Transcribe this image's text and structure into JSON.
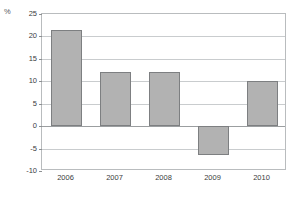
{
  "chart_data": {
    "type": "bar",
    "title": "",
    "subtitle": "",
    "xlabel": "",
    "ylabel": "%",
    "unit_label": "%",
    "categories": [
      "2006",
      "2007",
      "2008",
      "2009",
      "2010"
    ],
    "values": [
      21.5,
      12.0,
      12.0,
      -6.5,
      10.0
    ],
    "series": [
      {
        "name": "",
        "values": [
          21.5,
          12.0,
          12.0,
          -6.5,
          10.0
        ]
      }
    ],
    "ylim": [
      -10,
      25
    ],
    "ytick_labels": [
      "25",
      "20",
      "15",
      "10",
      "5",
      "0",
      "-5",
      "-10"
    ],
    "ytick_values": [
      25,
      20,
      15,
      10,
      5,
      0,
      -5,
      -10
    ],
    "grid": true,
    "grid_axis": "y",
    "legend": false,
    "legend_position": "none",
    "colors": {
      "bar_fill": "#b2b2b2",
      "bar_border": "#7d7f81",
      "gridline": "#c9ccce",
      "zero_line": "#9b9ea0",
      "frame": "#b9bcbe",
      "tick_text": "#3a3d40",
      "unit_text": "#55585c",
      "background": "#ffffff"
    }
  }
}
